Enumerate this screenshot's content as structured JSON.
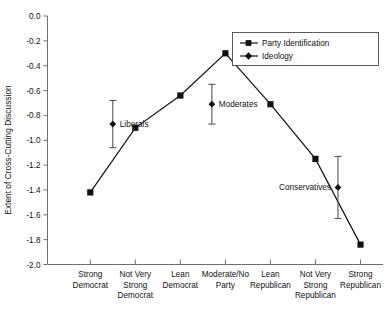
{
  "chart_data": {
    "type": "line",
    "title": "",
    "xlabel": "",
    "ylabel": "Extent of Cross-Cutting Discussion",
    "ylim": [
      -2.0,
      0.0
    ],
    "yticks": [
      0.0,
      -0.2,
      -0.4,
      -0.6,
      -0.8,
      -1.0,
      -1.2,
      -1.4,
      -1.6,
      -1.8,
      -2.0
    ],
    "ytick_labels": [
      "0.0",
      "-0.2",
      "-0.4",
      "-0.6",
      "-0.8",
      "-1.0",
      "-1.2",
      "-1.4",
      "-1.6",
      "-1.8",
      "-2.0"
    ],
    "grid": false,
    "legend_position": "top-right",
    "categories": [
      "Strong Democrat",
      "Not Very Strong Democrat",
      "Lean Democrat",
      "Moderate/No Party",
      "Lean Republican",
      "Not Very Strong Republican",
      "Strong Republican"
    ],
    "category_lines": [
      [
        "Strong",
        "Democrat"
      ],
      [
        "Not Very",
        "Strong",
        "Democrat"
      ],
      [
        "Lean",
        "Democrat"
      ],
      [
        "Moderate/No",
        "Party"
      ],
      [
        "Lean",
        "Republican"
      ],
      [
        "Not Very",
        "Strong",
        "Republican"
      ],
      [
        "Strong",
        "Republican"
      ]
    ],
    "series": [
      {
        "name": "Party Identification",
        "marker": "square",
        "x": [
          1,
          2,
          3,
          4,
          5,
          6,
          7
        ],
        "values": [
          -1.42,
          -0.9,
          -0.64,
          -0.3,
          -0.71,
          -1.15,
          -1.84
        ]
      },
      {
        "name": "Ideology",
        "marker": "diamond",
        "x": [
          1.5,
          3.7,
          6.5
        ],
        "values": [
          -0.87,
          -0.71,
          -1.38
        ],
        "error_low": [
          -1.06,
          -0.87,
          -1.63
        ],
        "error_high": [
          -0.68,
          -0.55,
          -1.13
        ],
        "point_labels": [
          "Liberals",
          "Moderates",
          "Conservatives"
        ]
      }
    ],
    "annotations": [
      {
        "text": "Liberals",
        "value": -0.87
      },
      {
        "text": "Moderates",
        "value": -0.71
      },
      {
        "text": "Conservatives",
        "value": -1.38
      }
    ],
    "legend": [
      {
        "label": "Party Identification",
        "marker": "square"
      },
      {
        "label": "Ideology",
        "marker": "diamond"
      }
    ]
  }
}
